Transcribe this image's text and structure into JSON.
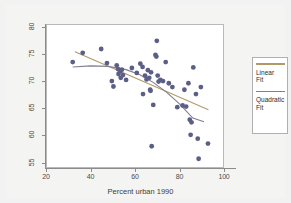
{
  "chart_data": {
    "type": "scatter",
    "title": "",
    "xlabel": "Percent urban 1990",
    "ylabel": "",
    "xlim": [
      20,
      100
    ],
    "ylim": [
      54,
      80.5
    ],
    "xticks": [
      20,
      40,
      60,
      80,
      100
    ],
    "yticks": [
      55,
      60,
      65,
      70,
      75,
      80
    ],
    "grid": false,
    "legend_position": "right-outside",
    "point_color": "#5b5f86",
    "series": [
      {
        "name": "Observations",
        "type": "scatter",
        "points": [
          [
            32.0,
            73.5
          ],
          [
            36.5,
            75.2
          ],
          [
            44.8,
            75.9
          ],
          [
            47.4,
            73.3
          ],
          [
            49.6,
            70.0
          ],
          [
            50.3,
            69.0
          ],
          [
            51.8,
            72.9
          ],
          [
            52.4,
            72.2
          ],
          [
            52.6,
            71.3
          ],
          [
            53.4,
            71.8
          ],
          [
            53.6,
            70.6
          ],
          [
            54.1,
            72.1
          ],
          [
            54.6,
            71.1
          ],
          [
            56.0,
            70.2
          ],
          [
            58.6,
            72.4
          ],
          [
            60.8,
            71.5
          ],
          [
            62.4,
            73.2
          ],
          [
            63.4,
            72.6
          ],
          [
            63.6,
            67.6
          ],
          [
            64.5,
            71.0
          ],
          [
            65.2,
            70.3
          ],
          [
            65.8,
            72.0
          ],
          [
            66.4,
            70.6
          ],
          [
            66.8,
            68.4
          ],
          [
            67.0,
            68.2
          ],
          [
            67.2,
            71.6
          ],
          [
            67.5,
            58.0
          ],
          [
            68.2,
            65.6
          ],
          [
            69.2,
            74.8
          ],
          [
            69.6,
            74.5
          ],
          [
            69.8,
            77.4
          ],
          [
            70.2,
            71.0
          ],
          [
            70.6,
            69.9
          ],
          [
            71.4,
            70.2
          ],
          [
            72.6,
            70.0
          ],
          [
            73.8,
            73.5
          ],
          [
            75.2,
            69.6
          ],
          [
            76.8,
            68.9
          ],
          [
            79.0,
            65.2
          ],
          [
            81.4,
            65.5
          ],
          [
            82.2,
            68.4
          ],
          [
            83.0,
            65.3
          ],
          [
            84.0,
            69.6
          ],
          [
            84.6,
            62.9
          ],
          [
            85.0,
            60.1
          ],
          [
            85.4,
            62.4
          ],
          [
            86.2,
            72.5
          ],
          [
            87.4,
            67.6
          ],
          [
            88.2,
            59.4
          ],
          [
            88.6,
            55.7
          ],
          [
            89.6,
            68.9
          ],
          [
            92.8,
            58.5
          ]
        ]
      },
      {
        "name": "Linear Fit",
        "type": "line",
        "color": "#b09a6b",
        "points": [
          [
            33.0,
            75.4
          ],
          [
            93.0,
            64.7
          ]
        ]
      },
      {
        "name": "Quadratic Fit",
        "type": "line",
        "color": "#807f92",
        "points": [
          [
            32.0,
            72.6
          ],
          [
            40.0,
            72.8
          ],
          [
            48.0,
            72.7
          ],
          [
            56.0,
            72.1
          ],
          [
            62.0,
            71.2
          ],
          [
            68.0,
            69.8
          ],
          [
            74.0,
            68.0
          ],
          [
            80.0,
            65.8
          ],
          [
            86.0,
            63.2
          ],
          [
            91.0,
            62.5
          ]
        ]
      }
    ]
  },
  "axes": {
    "x_title": "Percent urban 1990",
    "x_tick_labels": [
      "20",
      "40",
      "60",
      "80",
      "100"
    ],
    "y_tick_labels": [
      "55",
      "60",
      "65",
      "70",
      "75",
      "80"
    ]
  },
  "legend": {
    "entries": [
      {
        "label_line1": "Linear",
        "label_line2": "Fit",
        "color": "#b09a6b"
      },
      {
        "label_line1": "Quadratic",
        "label_line2": "Fit",
        "color": "#807f92"
      }
    ]
  }
}
